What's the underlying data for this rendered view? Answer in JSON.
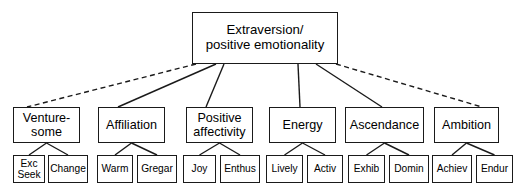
{
  "diagram": {
    "background_color": "#ffffff",
    "line_color": "#1a1a1a",
    "text_color": "#000000",
    "root": {
      "id": "root",
      "label": "Extraversion/\npositive emotionality",
      "x": 192,
      "y": 12,
      "w": 146,
      "h": 52
    },
    "branches": [
      {
        "id": "venturesome",
        "label": "Venture-\nsome",
        "x": 13,
        "y": 107,
        "w": 67,
        "h": 36,
        "edge_style": "dashed",
        "edge_from_x": 196,
        "edge_from_y": 64,
        "edge_to_x": 27,
        "edge_to_y": 107,
        "children": [
          {
            "id": "exc-seek",
            "label": "Exc\nSeek",
            "x": 13,
            "y": 155,
            "w": 32,
            "h": 28
          },
          {
            "id": "change",
            "label": "Change",
            "x": 48,
            "y": 155,
            "w": 40,
            "h": 28
          }
        ]
      },
      {
        "id": "affiliation",
        "label": "Affiliation",
        "x": 98,
        "y": 107,
        "w": 67,
        "h": 36,
        "edge_style": "solid",
        "edge_from_x": 216,
        "edge_from_y": 64,
        "edge_to_x": 118,
        "edge_to_y": 107,
        "children": [
          {
            "id": "warm",
            "label": "Warm",
            "x": 97,
            "y": 155,
            "w": 36,
            "h": 28
          },
          {
            "id": "gregar",
            "label": "Gregar",
            "x": 137,
            "y": 155,
            "w": 40,
            "h": 28
          }
        ]
      },
      {
        "id": "positive-affectivity",
        "label": "Positive\naffectivity",
        "x": 186,
        "y": 107,
        "w": 67,
        "h": 36,
        "edge_style": "solid",
        "edge_from_x": 224,
        "edge_from_y": 64,
        "edge_to_x": 206,
        "edge_to_y": 107,
        "children": [
          {
            "id": "joy",
            "label": "Joy",
            "x": 183,
            "y": 155,
            "w": 33,
            "h": 28
          },
          {
            "id": "enthus",
            "label": "Enthus",
            "x": 220,
            "y": 155,
            "w": 40,
            "h": 28
          }
        ]
      },
      {
        "id": "energy",
        "label": "Energy",
        "x": 269,
        "y": 107,
        "w": 67,
        "h": 36,
        "edge_style": "solid",
        "edge_from_x": 298,
        "edge_from_y": 64,
        "edge_to_x": 300,
        "edge_to_y": 107,
        "children": [
          {
            "id": "lively",
            "label": "Lively",
            "x": 266,
            "y": 155,
            "w": 37,
            "h": 28
          },
          {
            "id": "activ",
            "label": "Activ",
            "x": 307,
            "y": 155,
            "w": 36,
            "h": 28
          }
        ]
      },
      {
        "id": "ascendance",
        "label": "Ascendance",
        "x": 345,
        "y": 107,
        "w": 79,
        "h": 36,
        "edge_style": "solid",
        "edge_from_x": 316,
        "edge_from_y": 64,
        "edge_to_x": 382,
        "edge_to_y": 107,
        "children": [
          {
            "id": "exhib",
            "label": "Exhib",
            "x": 348,
            "y": 155,
            "w": 37,
            "h": 28
          },
          {
            "id": "domin",
            "label": "Domin",
            "x": 389,
            "y": 155,
            "w": 40,
            "h": 28
          }
        ]
      },
      {
        "id": "ambition",
        "label": "Ambition",
        "x": 434,
        "y": 107,
        "w": 65,
        "h": 36,
        "edge_style": "dashed",
        "edge_from_x": 336,
        "edge_from_y": 64,
        "edge_to_x": 482,
        "edge_to_y": 107,
        "children": [
          {
            "id": "achiev",
            "label": "Achiev",
            "x": 432,
            "y": 155,
            "w": 40,
            "h": 28
          },
          {
            "id": "endur",
            "label": "Endur",
            "x": 476,
            "y": 155,
            "w": 37,
            "h": 28
          }
        ]
      }
    ]
  }
}
